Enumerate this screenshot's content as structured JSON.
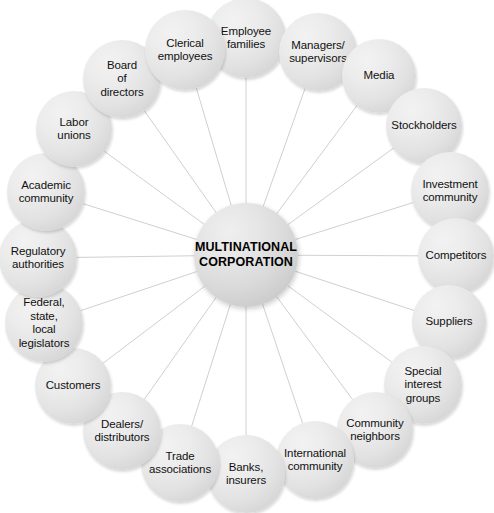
{
  "diagram": {
    "type": "hub-and-spoke",
    "canvas": {
      "width": 494,
      "height": 508
    },
    "colors": {
      "background": "#ffffff",
      "node_fill_light": "#f2f2f2",
      "node_fill_dark": "#c9c9c9",
      "hub_fill_light": "#efefef",
      "hub_fill_dark": "#bfbfbf",
      "edge": "#d0d0d0",
      "text": "#111111",
      "hub_text": "#000000"
    },
    "hub": {
      "label": "MULTINATIONAL\nCORPORATION",
      "cx": 246,
      "cy": 255,
      "r": 52
    },
    "spokes": [
      {
        "id": "employee-families",
        "label": "Employee\nfamilies",
        "cx": 246,
        "cy": 38,
        "r": 40
      },
      {
        "id": "managers-supervisors",
        "label": "Managers/\nsupervisors",
        "cx": 318,
        "cy": 52,
        "r": 39
      },
      {
        "id": "media",
        "label": "Media",
        "cx": 379,
        "cy": 76,
        "r": 37
      },
      {
        "id": "stockholders",
        "label": "Stockholders",
        "cx": 424,
        "cy": 126,
        "r": 38
      },
      {
        "id": "investment-community",
        "label": "Investment\ncommunity",
        "cx": 450,
        "cy": 191,
        "r": 39
      },
      {
        "id": "competitors",
        "label": "Competitors",
        "cx": 456,
        "cy": 256,
        "r": 38
      },
      {
        "id": "suppliers",
        "label": "Suppliers",
        "cx": 449,
        "cy": 322,
        "r": 37
      },
      {
        "id": "special-interest-groups",
        "label": "Special\ninterest\ngroups",
        "cx": 423,
        "cy": 385,
        "r": 39
      },
      {
        "id": "community-neighbors",
        "label": "Community\nneighbors",
        "cx": 375,
        "cy": 430,
        "r": 38
      },
      {
        "id": "international-community",
        "label": "International\ncommunity",
        "cx": 315,
        "cy": 460,
        "r": 39
      },
      {
        "id": "banks-insurers",
        "label": "Banks,\ninsurers",
        "cx": 246,
        "cy": 474,
        "r": 39
      },
      {
        "id": "trade-associations",
        "label": "Trade\nassociations",
        "cx": 180,
        "cy": 463,
        "r": 39
      },
      {
        "id": "dealers-distributors",
        "label": "Dealers/\ndistributors",
        "cx": 122,
        "cy": 431,
        "r": 39
      },
      {
        "id": "customers",
        "label": "Customers",
        "cx": 73,
        "cy": 386,
        "r": 38
      },
      {
        "id": "federal-state-local-legislators",
        "label": "Federal,\nstate,\nlocal\nlegislators",
        "cx": 44,
        "cy": 323,
        "r": 39
      },
      {
        "id": "regulatory-authorities",
        "label": "Regulatory\nauthorities",
        "cx": 38,
        "cy": 258,
        "r": 39
      },
      {
        "id": "academic-community",
        "label": "Academic\ncommunity",
        "cx": 46,
        "cy": 192,
        "r": 39
      },
      {
        "id": "labor-unions",
        "label": "Labor\nunions",
        "cx": 74,
        "cy": 129,
        "r": 38
      },
      {
        "id": "board-of-directors",
        "label": "Board\nof\ndirectors",
        "cx": 122,
        "cy": 79,
        "r": 39
      },
      {
        "id": "clerical-employees",
        "label": "Clerical\nemployees",
        "cx": 185,
        "cy": 50,
        "r": 40
      }
    ]
  }
}
